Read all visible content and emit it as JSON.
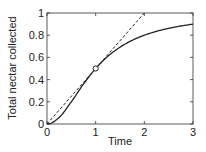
{
  "chart_data": {
    "type": "line",
    "title": "",
    "xlabel": "Time",
    "ylabel": "Total nectar collected",
    "xlim": [
      0,
      3
    ],
    "ylim": [
      0,
      1
    ],
    "xticks": [
      0,
      1,
      2,
      3
    ],
    "xtick_labels": [
      "0",
      "1",
      "2",
      "3"
    ],
    "yticks": [
      0,
      0.2,
      0.4,
      0.6,
      0.8,
      1
    ],
    "ytick_labels": [
      "0",
      "0.2",
      "0.4",
      "0.6",
      "0.8",
      "1"
    ],
    "grid": false,
    "legend": "none",
    "series": [
      {
        "name": "Total nectar collected",
        "style": "solid",
        "color": "#222222",
        "x": [
          0,
          0.25,
          0.5,
          0.75,
          1,
          1.25,
          1.5,
          1.75,
          2,
          2.25,
          2.5,
          2.75,
          3
        ],
        "y": [
          0,
          0.059,
          0.2,
          0.36,
          0.5,
          0.61,
          0.692,
          0.754,
          0.8,
          0.835,
          0.862,
          0.883,
          0.9
        ]
      },
      {
        "name": "Tangent line",
        "style": "dashed",
        "color": "#222222",
        "x": [
          0,
          2
        ],
        "y": [
          0,
          1
        ]
      }
    ],
    "annotations": [
      {
        "type": "open-circle-marker",
        "x": 1,
        "y": 0.5
      }
    ]
  }
}
